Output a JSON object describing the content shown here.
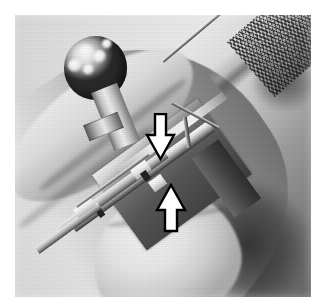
{
  "page": {
    "background_color": "#ffffff",
    "width": 327,
    "height": 308
  },
  "photo": {
    "caption_text": "",
    "alt": "Gloveless hand holding a ball-handled surgical instrument; two outline arrows mark the blade-carrier detail",
    "subject": "surgical instrument held in hand",
    "color_mode": "grayscale",
    "frame": {
      "left": 15,
      "top": 15,
      "width": 296,
      "height": 282
    },
    "background_tone": "#e0e0e0",
    "shadow_tone": "#4a4a4a"
  },
  "objects": {
    "ball_handle": {
      "name": "ball-handle",
      "tone_light": "#fbfbfb",
      "tone_dark": "#2a2a2a"
    },
    "collar": {
      "name": "handle-collar",
      "tone": "#b9b9b9"
    },
    "body_block": {
      "name": "instrument-body",
      "tone_light": "#f0f0f0",
      "tone_dark": "#3e3e3e"
    },
    "rail": {
      "name": "blade-carrier-rail",
      "tone": "#e6e6e6"
    },
    "wire": {
      "name": "fine-wire",
      "tone": "#8e8e8e"
    },
    "knurled_handle": {
      "name": "knurled-handle",
      "tone": "#b0b0b0"
    },
    "hand": {
      "name": "hand",
      "tone": "#e0e0e0"
    },
    "thumb": {
      "name": "thumb",
      "tone": "#f2f2f2"
    }
  },
  "annotations": {
    "arrow_down": {
      "label": "",
      "direction": "down",
      "fill": "#ffffff",
      "stroke": "#000000",
      "points_at": "upper notch of blade carrier",
      "position": {
        "left": 144,
        "top": 113,
        "width": 33,
        "height": 48
      }
    },
    "arrow_up": {
      "label": "",
      "direction": "up",
      "fill": "#ffffff",
      "stroke": "#000000",
      "points_at": "lower notch of blade carrier",
      "position": {
        "left": 154,
        "top": 183,
        "width": 34,
        "height": 50
      }
    }
  }
}
